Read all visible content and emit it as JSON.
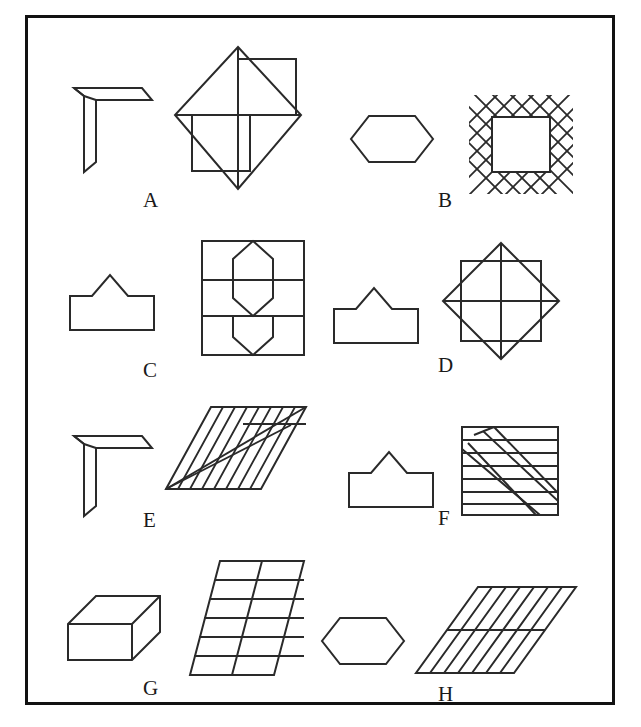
{
  "page": {
    "background_color": "#ffffff",
    "stroke_color": "#2a2a2a",
    "frame_color": "#111111",
    "frame": {
      "x": 25,
      "y": 15,
      "width": 590,
      "height": 690,
      "border_width": 3
    }
  },
  "items": [
    {
      "label": "A",
      "label_x": 143,
      "label_y": 190,
      "left_figure": {
        "name": "bent-l-strip",
        "description": "L-shaped bent narrow strip with mitred ends"
      },
      "right_figure": {
        "name": "diamond-with-two-squares",
        "description": "Diamond with vertical and horizontal cross lines and squares attached upper-right and lower-left"
      }
    },
    {
      "label": "B",
      "label_x": 438,
      "label_y": 190,
      "left_figure": {
        "name": "horizontal-hexagon",
        "description": "Wide horizontal hexagon outline"
      },
      "right_figure": {
        "name": "crosshatch-bordered-square",
        "description": "Square with diagonal crosshatch lattice border and blank centre square"
      }
    },
    {
      "label": "C",
      "label_x": 143,
      "label_y": 372,
      "left_figure": {
        "name": "tent-pentagon",
        "description": "Rectangle with triangular peak on top edge"
      },
      "right_figure": {
        "name": "rectangle-with-twin-hexagons",
        "description": "Rectangle split by two horizontal lines containing two tall hexagons meeting at the centre"
      }
    },
    {
      "label": "D",
      "label_x": 438,
      "label_y": 372,
      "left_figure": {
        "name": "tent-pentagon",
        "description": "Rectangle with triangular peak on top edge"
      },
      "right_figure": {
        "name": "square-diamond-star",
        "description": "Square overlaid by rotated diamond forming eight-point star with cross lines"
      }
    },
    {
      "label": "E",
      "label_x": 143,
      "label_y": 524,
      "left_figure": {
        "name": "bent-l-strip",
        "description": "L-shaped bent narrow strip with mitred ends"
      },
      "right_figure": {
        "name": "striped-parallelogram",
        "description": "Slanted parallelogram with vertical stripes and long diagonal band"
      }
    },
    {
      "label": "F",
      "label_x": 438,
      "label_y": 524,
      "left_figure": {
        "name": "tent-pentagon",
        "description": "Rectangle with triangular peak on top edge"
      },
      "right_figure": {
        "name": "square-with-diagonal-band",
        "description": "Square ruled with horizontal lines crossed by a diagonal band of squares"
      }
    },
    {
      "label": "G",
      "label_x": 143,
      "label_y": 693,
      "left_figure": {
        "name": "isometric-box",
        "description": "Three dimensional rectangular box drawn in oblique projection"
      },
      "right_figure": {
        "name": "slanted-grid-parallelogram",
        "description": "Slanted parallelogram ruled into a grid of horizontal rows and one vertical divider"
      }
    },
    {
      "label": "H",
      "label_x": 438,
      "label_y": 700,
      "left_figure": {
        "name": "horizontal-hexagon",
        "description": "Wide horizontal hexagon outline"
      },
      "right_figure": {
        "name": "diagonally-hatched-parallelogram",
        "description": "Slanted parallelogram filled with diagonal hatch lines and one horizontal divider"
      }
    }
  ]
}
